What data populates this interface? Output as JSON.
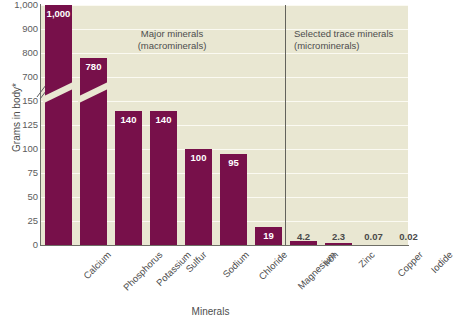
{
  "chart_data": {
    "type": "bar",
    "title": "",
    "xlabel": "Minerals",
    "ylabel": "Grams in body*",
    "categories": [
      "Calcium",
      "Phosphorus",
      "Potassium",
      "Sulfur",
      "Sodium",
      "Chloride",
      "Magnesium",
      "Iron",
      "Zinc",
      "Copper",
      "Iodide"
    ],
    "values": [
      1000,
      780,
      140,
      140,
      100,
      95,
      19,
      4.2,
      2.3,
      0.07,
      0.02
    ],
    "value_labels": [
      "1,000",
      "780",
      "140",
      "140",
      "100",
      "95",
      "19",
      "4.2",
      "2.3",
      "0.07",
      "0.02"
    ],
    "y_ticks": [
      "1,000",
      "900",
      "800",
      "700",
      "150",
      "125",
      "100",
      "75",
      "50",
      "25",
      "0"
    ],
    "y_axis_broken": true,
    "y_break_between": [
      "700",
      "150"
    ],
    "grid": true,
    "legend_position": "none",
    "annotations": [
      {
        "name": "major-minerals-note",
        "line1": "Major minerals",
        "line2": "(macrominerals)"
      },
      {
        "name": "trace-minerals-note",
        "line1": "Selected trace minerals",
        "line2": "(microminerals)"
      }
    ],
    "colors": {
      "bar": "#77104a",
      "plot_background": "#e9e7d2",
      "gridline": "#fbfaf2",
      "axis": "#6e6e66",
      "text": "#4d4d4d",
      "value_label_inside": "#ffffff"
    }
  }
}
